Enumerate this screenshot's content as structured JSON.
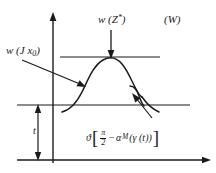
{
  "figure": {
    "domain": "diagram",
    "background_color": "#ffffff",
    "ink_color": "#1a1a1a",
    "width": 216,
    "height": 173,
    "labels": {
      "peak_label": "w (Z*)",
      "peak_label_base": "w (Z",
      "peak_label_sup": "*",
      "peak_label_close": ")",
      "left_label": "w (J x0)",
      "left_label_base": "w (J x",
      "left_label_sub": "0",
      "left_label_close": ")",
      "corner_label": "(W)",
      "height_label": "t",
      "formula_leading": "ϑ",
      "formula_bracket_open": "[",
      "formula_numerator": "π",
      "formula_denominator": "2",
      "formula_minus": "−",
      "formula_alpha": "α",
      "formula_alpha_sub": "M",
      "formula_tail": "(γ (t))",
      "formula_bracket_close": "]",
      "formula_full": "ϑ[π/2 − αM(γ(t))]"
    },
    "elements": {
      "vertical_axis": "w-axis",
      "horizontal_axis": "t-axis",
      "baseline": "reference-level-line",
      "peak_line": "peak-level-line",
      "curve": "bell-shaped-wave-profile",
      "height_arrow": "double-headed-height-arrow",
      "peak_arrow": "downward-pointer-to-peak",
      "left_arrow": "pointer-to-left-flank",
      "notch_arrow": "pointer-to-right-notch"
    }
  }
}
